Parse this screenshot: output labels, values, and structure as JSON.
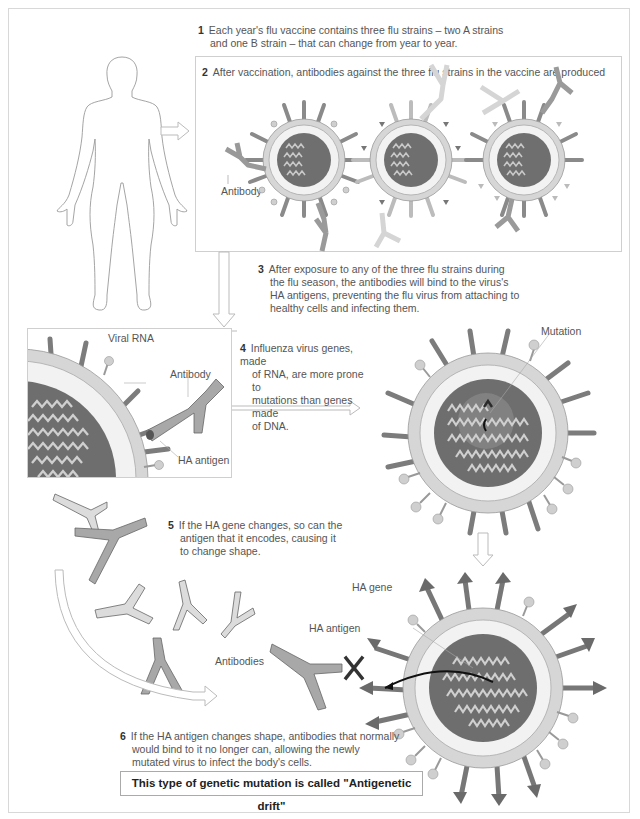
{
  "steps": [
    {
      "num": "1",
      "text": "Each year's flu vaccine contains three flu strains – two A strains and one B strain – that can change from year to year.",
      "lines": [
        "Each year's flu vaccine contains three flu strains – two A strains",
        "and one B strain – that can change from year to year."
      ]
    },
    {
      "num": "2",
      "text": "After vaccination, antibodies against the three flu strains in the vaccine are produced"
    },
    {
      "num": "3",
      "text": "After exposure to any of the three flu strains during the flu season, the antibodies will bind to the virus's HA antigens, preventing the flu virus from attaching to healthy cells and infecting them.",
      "lines": [
        "After exposure to any of the three flu strains during",
        "the flu season, the antibodies will bind to the virus's",
        "HA antigens, preventing the flu virus from attaching to",
        "healthy cells and infecting them."
      ]
    },
    {
      "num": "4",
      "text": "Influenza virus genes, made of RNA, are more prone to mutations than genes made of DNA.",
      "lines": [
        "Influenza virus genes, made",
        "of RNA, are more prone to",
        "mutations than genes made",
        "of DNA."
      ]
    },
    {
      "num": "5",
      "text": "If the HA gene changes, so can the antigen that it encodes, causing it to change shape.",
      "lines": [
        "If the HA gene changes, so can the",
        "antigen that it encodes, causing it",
        "to change shape."
      ]
    },
    {
      "num": "6",
      "text": "If the HA antigen changes shape, antibodies that normally would bind to it no longer can, allowing the newly mutated virus to infect the body's cells.",
      "lines": [
        "If the HA antigen changes shape, antibodies that normally",
        "would bind to it no longer can, allowing the newly",
        "mutated virus to infect the body's cells."
      ]
    }
  ],
  "labels": {
    "antibody_vaccine": "Antibody",
    "viral_rna": "Viral RNA",
    "antibody_panel": "Antibody",
    "ha_antigen_panel": "HA antigen",
    "mutation": "Mutation",
    "ha_gene": "HA gene",
    "ha_antigen_mutated": "HA antigen",
    "antibodies": "Antibodies"
  },
  "callout": "This type of genetic mutation is called \"Antigenetic drift\"",
  "colors": {
    "core": "#6e6e6e",
    "envelope": "#d9d9d9",
    "membrane": "#f4f4f4",
    "spike": "#7a7a7a",
    "mutated_spike": "#6a6a6a",
    "antibody_dark": "#9a9a9a",
    "antibody_light": "#dcdcdc",
    "block_x": "#333333"
  }
}
